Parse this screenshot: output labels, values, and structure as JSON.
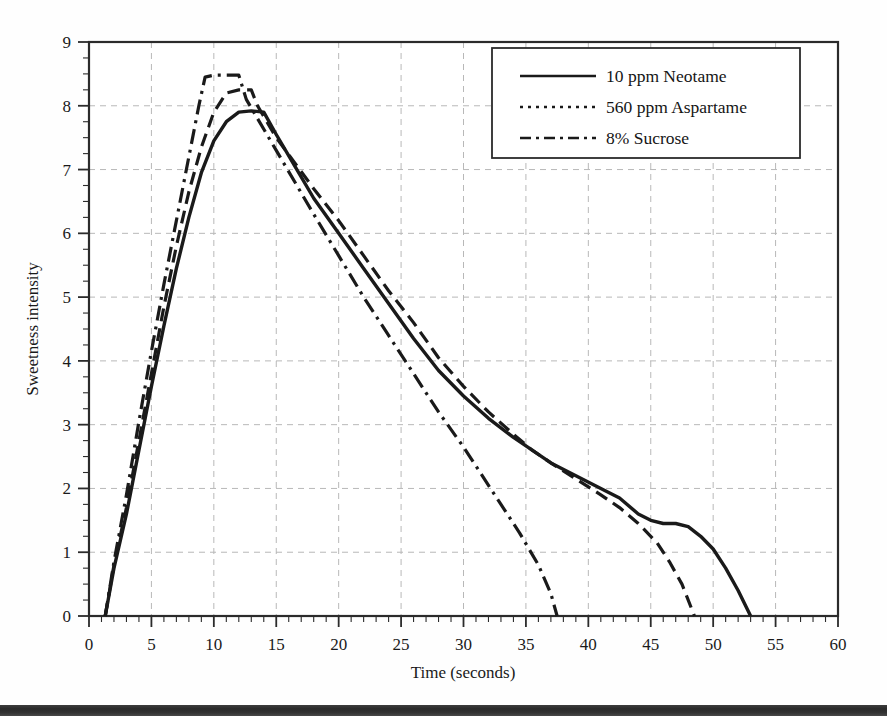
{
  "chart_data": {
    "type": "line",
    "title": "",
    "xlabel": "Time (seconds)",
    "ylabel": "Sweetness intensity",
    "xlim": [
      0,
      60
    ],
    "ylim": [
      0,
      9
    ],
    "xticks": [
      0,
      5,
      10,
      15,
      20,
      25,
      30,
      35,
      40,
      45,
      50,
      55,
      60
    ],
    "yticks": [
      0,
      1,
      2,
      3,
      4,
      5,
      6,
      7,
      8,
      9
    ],
    "xtick_labels": [
      "0",
      "5",
      "10",
      "15",
      "20",
      "25",
      "30",
      "35",
      "40",
      "45",
      "50",
      "55",
      "60"
    ],
    "ytick_labels": [
      "0",
      "1",
      "2",
      "3",
      "4",
      "5",
      "6",
      "7",
      "8",
      "9"
    ],
    "x_minor_tick_interval": 1,
    "y_minor_tick_interval": 0.25,
    "grid": true,
    "grid_style": "dashed",
    "grid_color": "#b8b8b8",
    "legend_position": "top-right",
    "line_color": "#1a1a1a",
    "series": [
      {
        "name": "10 ppm Neotame",
        "style": "solid",
        "points": [
          [
            1.3,
            0.0
          ],
          [
            2.0,
            0.75
          ],
          [
            3.0,
            1.6
          ],
          [
            4.0,
            2.6
          ],
          [
            5.0,
            3.6
          ],
          [
            6.0,
            4.55
          ],
          [
            7.0,
            5.45
          ],
          [
            8.0,
            6.25
          ],
          [
            9.0,
            6.95
          ],
          [
            10.0,
            7.45
          ],
          [
            11.0,
            7.75
          ],
          [
            12.0,
            7.9
          ],
          [
            13.0,
            7.92
          ],
          [
            14.0,
            7.9
          ],
          [
            15.0,
            7.55
          ],
          [
            16.5,
            7.05
          ],
          [
            18.0,
            6.55
          ],
          [
            20.0,
            6.0
          ],
          [
            22.0,
            5.45
          ],
          [
            24.0,
            4.9
          ],
          [
            26.0,
            4.35
          ],
          [
            28.0,
            3.85
          ],
          [
            30.0,
            3.45
          ],
          [
            32.0,
            3.1
          ],
          [
            34.0,
            2.8
          ],
          [
            35.5,
            2.6
          ],
          [
            37.0,
            2.4
          ],
          [
            39.0,
            2.2
          ],
          [
            41.0,
            2.0
          ],
          [
            42.5,
            1.85
          ],
          [
            44.0,
            1.6
          ],
          [
            45.0,
            1.5
          ],
          [
            46.0,
            1.45
          ],
          [
            47.0,
            1.45
          ],
          [
            48.0,
            1.4
          ],
          [
            49.0,
            1.25
          ],
          [
            50.0,
            1.05
          ],
          [
            51.0,
            0.75
          ],
          [
            52.0,
            0.4
          ],
          [
            53.0,
            0.0
          ]
        ]
      },
      {
        "name": "560 ppm Aspartame",
        "style": "dashed",
        "points": [
          [
            1.3,
            0.0
          ],
          [
            2.0,
            0.8
          ],
          [
            3.0,
            1.7
          ],
          [
            4.0,
            2.75
          ],
          [
            5.0,
            3.8
          ],
          [
            6.0,
            4.85
          ],
          [
            7.0,
            5.8
          ],
          [
            8.0,
            6.65
          ],
          [
            9.0,
            7.35
          ],
          [
            10.0,
            7.9
          ],
          [
            11.0,
            8.2
          ],
          [
            12.0,
            8.25
          ],
          [
            13.0,
            8.25
          ],
          [
            13.5,
            8.0
          ],
          [
            15.0,
            7.5
          ],
          [
            16.5,
            7.1
          ],
          [
            18.0,
            6.7
          ],
          [
            20.0,
            6.2
          ],
          [
            22.0,
            5.65
          ],
          [
            24.0,
            5.1
          ],
          [
            26.0,
            4.6
          ],
          [
            28.0,
            4.05
          ],
          [
            30.0,
            3.6
          ],
          [
            32.0,
            3.2
          ],
          [
            34.0,
            2.85
          ],
          [
            35.5,
            2.6
          ],
          [
            37.0,
            2.4
          ],
          [
            39.0,
            2.15
          ],
          [
            41.0,
            1.9
          ],
          [
            42.5,
            1.7
          ],
          [
            44.0,
            1.45
          ],
          [
            45.0,
            1.25
          ],
          [
            45.5,
            1.15
          ],
          [
            46.5,
            0.85
          ],
          [
            47.5,
            0.5
          ],
          [
            48.5,
            0.0
          ]
        ]
      },
      {
        "name": "8% Sucrose",
        "style": "dash-dot",
        "points": [
          [
            1.3,
            0.0
          ],
          [
            2.0,
            0.85
          ],
          [
            3.0,
            1.9
          ],
          [
            4.0,
            3.05
          ],
          [
            5.0,
            4.15
          ],
          [
            6.0,
            5.2
          ],
          [
            7.0,
            6.2
          ],
          [
            8.0,
            7.2
          ],
          [
            8.8,
            8.0
          ],
          [
            9.3,
            8.45
          ],
          [
            10.0,
            8.48
          ],
          [
            11.0,
            8.48
          ],
          [
            12.0,
            8.48
          ],
          [
            12.6,
            8.1
          ],
          [
            13.5,
            7.8
          ],
          [
            15.0,
            7.3
          ],
          [
            16.5,
            6.8
          ],
          [
            18.0,
            6.3
          ],
          [
            20.0,
            5.65
          ],
          [
            22.0,
            5.0
          ],
          [
            24.0,
            4.4
          ],
          [
            26.0,
            3.8
          ],
          [
            28.0,
            3.2
          ],
          [
            30.0,
            2.65
          ],
          [
            31.5,
            2.2
          ],
          [
            33.0,
            1.75
          ],
          [
            34.5,
            1.3
          ],
          [
            36.0,
            0.8
          ],
          [
            37.0,
            0.35
          ],
          [
            37.5,
            0.0
          ]
        ]
      }
    ]
  },
  "legend": {
    "entries": [
      {
        "label": "10 ppm Neotame",
        "style": "solid"
      },
      {
        "label": "560 ppm Aspartame",
        "style": "dashed"
      },
      {
        "label": "8% Sucrose",
        "style": "dash-dot"
      }
    ]
  },
  "axes": {
    "x_title": "Time (seconds)",
    "y_title": "Sweetness intensity"
  }
}
